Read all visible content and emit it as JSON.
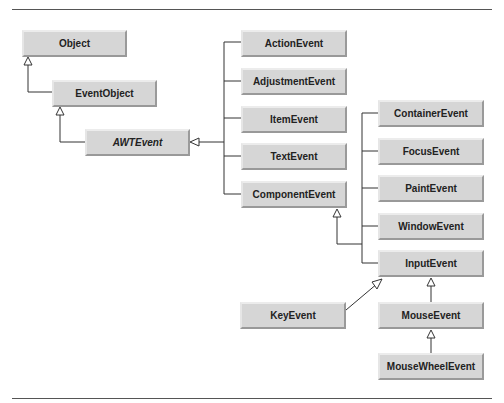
{
  "diagram": {
    "title": "",
    "nodes": [
      {
        "id": "object",
        "label": "Object",
        "x": 22,
        "y": 30,
        "w": 105,
        "h": 27
      },
      {
        "id": "eventobject",
        "label": "EventObject",
        "x": 52,
        "y": 80,
        "w": 105,
        "h": 27
      },
      {
        "id": "awtevent",
        "label": "AWTEvent",
        "x": 85,
        "y": 129,
        "w": 105,
        "h": 27,
        "italic": true
      },
      {
        "id": "actionevent",
        "label": "ActionEvent",
        "x": 241,
        "y": 30,
        "w": 106,
        "h": 27
      },
      {
        "id": "adjustmentevent",
        "label": "AdjustmentEvent",
        "x": 241,
        "y": 68,
        "w": 106,
        "h": 27
      },
      {
        "id": "itemevent",
        "label": "ItemEvent",
        "x": 241,
        "y": 106,
        "w": 106,
        "h": 27
      },
      {
        "id": "textevent",
        "label": "TextEvent",
        "x": 241,
        "y": 143,
        "w": 106,
        "h": 27
      },
      {
        "id": "componentevent",
        "label": "ComponentEvent",
        "x": 241,
        "y": 181,
        "w": 106,
        "h": 27
      },
      {
        "id": "containerevent",
        "label": "ContainerEvent",
        "x": 378,
        "y": 100,
        "w": 106,
        "h": 27
      },
      {
        "id": "focusevent",
        "label": "FocusEvent",
        "x": 378,
        "y": 138,
        "w": 106,
        "h": 27
      },
      {
        "id": "paintevent",
        "label": "PaintEvent",
        "x": 378,
        "y": 175,
        "w": 106,
        "h": 27
      },
      {
        "id": "windowevent",
        "label": "WindowEvent",
        "x": 378,
        "y": 213,
        "w": 106,
        "h": 27
      },
      {
        "id": "inputevent",
        "label": "InputEvent",
        "x": 378,
        "y": 250,
        "w": 106,
        "h": 27
      },
      {
        "id": "keyevent",
        "label": "KeyEvent",
        "x": 240,
        "y": 302,
        "w": 106,
        "h": 27
      },
      {
        "id": "mouseevent",
        "label": "MouseEvent",
        "x": 378,
        "y": 302,
        "w": 106,
        "h": 27
      },
      {
        "id": "mousewheelevent",
        "label": "MouseWheelEvent",
        "x": 378,
        "y": 353,
        "w": 106,
        "h": 27
      }
    ],
    "edges": [
      {
        "from": "eventobject",
        "to": "object",
        "type": "inheritance"
      },
      {
        "from": "awtevent",
        "to": "eventobject",
        "type": "inheritance"
      },
      {
        "from": "actionevent",
        "to": "awtevent",
        "type": "inheritance"
      },
      {
        "from": "adjustmentevent",
        "to": "awtevent",
        "type": "inheritance"
      },
      {
        "from": "itemevent",
        "to": "awtevent",
        "type": "inheritance"
      },
      {
        "from": "textevent",
        "to": "awtevent",
        "type": "inheritance"
      },
      {
        "from": "componentevent",
        "to": "awtevent",
        "type": "inheritance"
      },
      {
        "from": "containerevent",
        "to": "componentevent",
        "type": "inheritance"
      },
      {
        "from": "focusevent",
        "to": "componentevent",
        "type": "inheritance"
      },
      {
        "from": "paintevent",
        "to": "componentevent",
        "type": "inheritance"
      },
      {
        "from": "windowevent",
        "to": "componentevent",
        "type": "inheritance"
      },
      {
        "from": "inputevent",
        "to": "componentevent",
        "type": "inheritance"
      },
      {
        "from": "keyevent",
        "to": "inputevent",
        "type": "inheritance"
      },
      {
        "from": "mouseevent",
        "to": "inputevent",
        "type": "inheritance"
      },
      {
        "from": "mousewheelevent",
        "to": "mouseevent",
        "type": "inheritance"
      }
    ]
  }
}
